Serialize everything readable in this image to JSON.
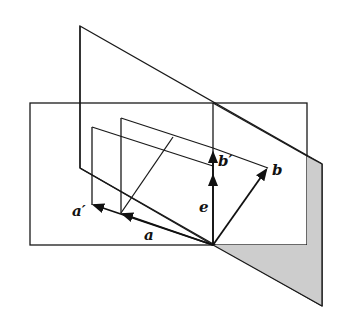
{
  "diagram": {
    "labels": {
      "a_prime": "a′",
      "a": "a",
      "e": "e",
      "b_prime": "b′",
      "b": "b"
    },
    "colors": {
      "plane_fill": "#cfcfcf",
      "plane_fill_light": "#f2f2f2",
      "stroke": "#1a1a1a",
      "background": "#ffffff"
    },
    "geometry": {
      "origin": [
        213,
        245
      ],
      "horizontal_plane": [
        [
          30,
          103
        ],
        [
          307,
          103
        ],
        [
          307,
          245
        ],
        [
          30,
          245
        ]
      ],
      "tilted_plane": [
        [
          80,
          26
        ],
        [
          322,
          164
        ],
        [
          322,
          306
        ],
        [
          80,
          168
        ]
      ],
      "vectors": {
        "a": {
          "from": [
            213,
            245
          ],
          "to": [
            121,
            213
          ]
        },
        "a_prime": {
          "from": [
            213,
            245
          ],
          "to": [
            92,
            205
          ]
        },
        "e": {
          "from": [
            213,
            245
          ],
          "to": [
            213,
            153
          ]
        },
        "b": {
          "from": [
            213,
            245
          ],
          "to": [
            268,
            168
          ]
        }
      }
    }
  }
}
